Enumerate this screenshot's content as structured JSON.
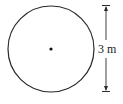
{
  "diagram": {
    "shape": "circle",
    "center_dot": true,
    "dimension": {
      "label": "3 m",
      "orientation": "vertical",
      "measures": "diameter"
    },
    "colors": {
      "stroke": "#2a2a2a",
      "background": "#ffffff"
    }
  }
}
